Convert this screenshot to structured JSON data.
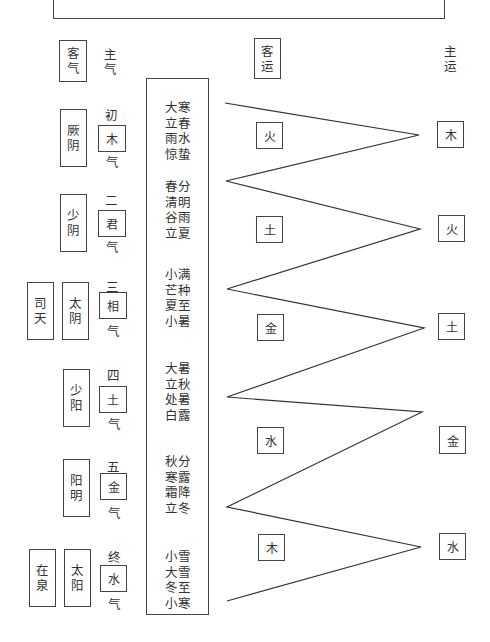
{
  "headers": {
    "guest_qi": "客气",
    "host_qi": "主气",
    "guest_yun": "客运",
    "host_yun": "主运"
  },
  "stems": {
    "si_tian": "司天",
    "zai_quan": "在泉"
  },
  "guest_qi": [
    {
      "name": "厥阴"
    },
    {
      "name": "少阴"
    },
    {
      "name": "太阴"
    },
    {
      "name": "少阳"
    },
    {
      "name": "阳明"
    },
    {
      "name": "太阳"
    }
  ],
  "host_qi": [
    {
      "ordinal": "初",
      "element": "木",
      "suffix": "气"
    },
    {
      "ordinal": "二",
      "element": "君",
      "suffix": "气"
    },
    {
      "ordinal": "三",
      "element": "相",
      "suffix": "气"
    },
    {
      "ordinal": "四",
      "element": "土",
      "suffix": "气"
    },
    {
      "ordinal": "五",
      "element": "金",
      "suffix": "气"
    },
    {
      "ordinal": "终",
      "element": "水",
      "suffix": "气"
    }
  ],
  "solar_terms": [
    [
      "大寒",
      "立春",
      "雨水",
      "惊蛰"
    ],
    [
      "春分",
      "清明",
      "谷雨",
      "立夏"
    ],
    [
      "小满",
      "芒种",
      "夏至",
      "小暑"
    ],
    [
      "大暑",
      "立秋",
      "处暑",
      "白露"
    ],
    [
      "秋分",
      "寒露",
      "霜降",
      "立冬"
    ],
    [
      "小雪",
      "大雪",
      "冬至",
      "小寒"
    ]
  ],
  "guest_yun": [
    "火",
    "土",
    "金",
    "水",
    "木"
  ],
  "host_yun": [
    "木",
    "火",
    "土",
    "金",
    "水"
  ]
}
